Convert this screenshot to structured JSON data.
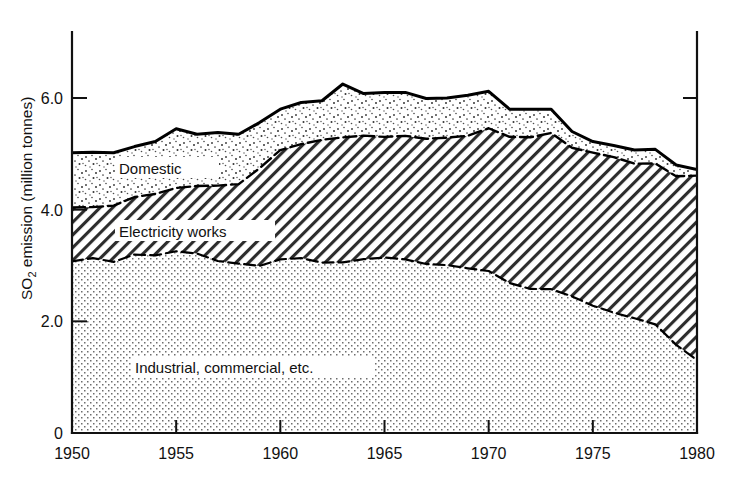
{
  "figure": {
    "background": "#ffffff",
    "ink": "#111111"
  },
  "axes": {
    "y_title_main": "SO",
    "y_title_sub": "2",
    "y_title_rest": " emission (million tonnes)",
    "y_ticks": [
      "0",
      "2.0",
      "4.0",
      "6.0"
    ],
    "y_tick_values": [
      0,
      2.0,
      4.0,
      6.0
    ],
    "x_ticks": [
      "1950",
      "1955",
      "1960",
      "1965",
      "1970",
      "1975",
      "1980"
    ],
    "x_tick_values": [
      1950,
      1955,
      1960,
      1965,
      1970,
      1975,
      1980
    ],
    "xlim": [
      1950,
      1980
    ],
    "ylim": [
      0,
      6.95
    ],
    "grid": false
  },
  "series_labels": {
    "domestic": "Domestic",
    "electricity": "Electricity works",
    "industrial": "Industrial, commercial, etc."
  },
  "chart_data": {
    "type": "area",
    "stacked": true,
    "title": "",
    "subtitle": "",
    "xlabel": "",
    "ylabel": "SO2 emission (million tonnes)",
    "xlim": [
      1950,
      1980
    ],
    "ylim": [
      0,
      6.95
    ],
    "grid": false,
    "legend_position": "inline-on-bands",
    "x": [
      1950,
      1951,
      1952,
      1953,
      1954,
      1955,
      1956,
      1957,
      1958,
      1959,
      1960,
      1961,
      1962,
      1963,
      1964,
      1965,
      1966,
      1967,
      1968,
      1969,
      1970,
      1971,
      1972,
      1973,
      1974,
      1975,
      1976,
      1977,
      1978,
      1979,
      1980
    ],
    "series": [
      {
        "name": "Industrial, commercial, etc.",
        "fill": "dotted-light",
        "values": [
          3.1,
          3.12,
          3.05,
          3.18,
          3.2,
          3.28,
          3.22,
          3.08,
          3.05,
          3.02,
          3.1,
          3.12,
          3.05,
          3.08,
          3.12,
          3.15,
          3.12,
          3.05,
          2.98,
          2.95,
          2.92,
          2.7,
          2.6,
          2.58,
          2.42,
          2.3,
          2.18,
          2.05,
          1.92,
          1.6,
          1.32
        ]
      },
      {
        "name": "Electricity works",
        "fill": "diagonal-hatch",
        "values": [
          0.92,
          0.95,
          1.05,
          1.05,
          1.1,
          1.12,
          1.18,
          1.35,
          1.4,
          1.72,
          1.95,
          2.08,
          2.18,
          2.22,
          2.18,
          2.15,
          2.18,
          2.22,
          2.3,
          2.38,
          2.52,
          2.62,
          2.68,
          2.82,
          2.7,
          2.7,
          2.75,
          2.8,
          2.88,
          3.0,
          3.3
        ]
      },
      {
        "name": "Domestic",
        "fill": "dotted-coarse",
        "values": [
          1.0,
          0.96,
          0.92,
          0.9,
          0.92,
          1.05,
          0.95,
          0.95,
          0.9,
          0.82,
          0.75,
          0.72,
          0.72,
          0.95,
          0.78,
          0.8,
          0.8,
          0.72,
          0.72,
          0.72,
          0.68,
          0.48,
          0.52,
          0.4,
          0.28,
          0.22,
          0.22,
          0.22,
          0.28,
          0.2,
          0.1
        ]
      }
    ],
    "totals": [
      5.02,
      5.03,
      5.02,
      5.13,
      5.22,
      5.45,
      5.35,
      5.38,
      5.35,
      5.56,
      5.8,
      5.92,
      5.95,
      6.25,
      6.08,
      6.1,
      6.1,
      5.99,
      6.0,
      6.05,
      6.12,
      5.8,
      5.8,
      5.8,
      5.4,
      5.22,
      5.15,
      5.07,
      5.08,
      4.8,
      4.72
    ]
  }
}
